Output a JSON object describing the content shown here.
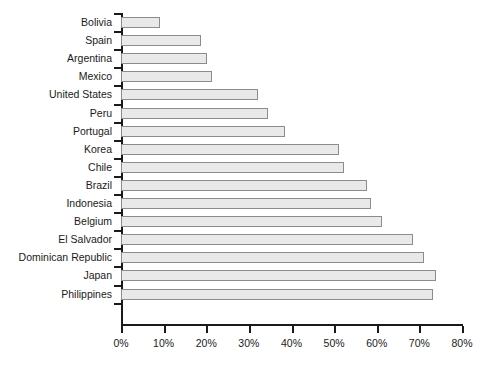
{
  "chart_data": {
    "type": "bar",
    "orientation": "horizontal",
    "title": "",
    "subtitle": "",
    "xlabel": "",
    "ylabel": "",
    "xlim": [
      0,
      80
    ],
    "grid": false,
    "legend": null,
    "x_tick_labels": [
      "0%",
      "10%",
      "20%",
      "30%",
      "40%",
      "50%",
      "60%",
      "70%",
      "80%"
    ],
    "x_tick_values": [
      0,
      10,
      20,
      30,
      40,
      50,
      60,
      70,
      80
    ],
    "categories": [
      "Bolivia",
      "Spain",
      "Argentina",
      "Mexico",
      "United States",
      "Peru",
      "Portugal",
      "Korea",
      "Chile",
      "Brazil",
      "Indonesia",
      "Belgium",
      "El Salvador",
      "Dominican Republic",
      "Japan",
      "Philippines"
    ],
    "values": [
      9.2,
      18.8,
      20.2,
      21.4,
      32.2,
      34.5,
      38.5,
      51.2,
      52.3,
      57.7,
      58.7,
      61.3,
      68.5,
      71.1,
      74.0,
      73.2
    ],
    "bar_fill_color": "#e9e9e9",
    "bar_border_color": "#8c8c8c",
    "axis_color": "#1a1a1a",
    "background_color": "#ffffff"
  }
}
